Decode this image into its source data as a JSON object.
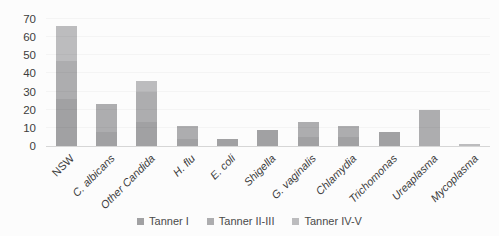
{
  "chart_data": {
    "type": "bar",
    "stacked": true,
    "title": "",
    "categories": [
      "NSW",
      "C. albicans",
      "Other Candida",
      "H. flu",
      "E. coli",
      "Shigella",
      "G. vaginalis",
      "Chlamydia",
      "Trichomonas",
      "Ureaplasma",
      "Mycoplasma"
    ],
    "categories_italic": [
      false,
      true,
      true,
      true,
      true,
      true,
      true,
      true,
      true,
      true,
      true
    ],
    "series": [
      {
        "name": "Tanner I",
        "color": "#a1a1a3",
        "values": [
          26,
          8,
          13,
          4,
          4,
          9,
          5,
          5,
          8,
          0,
          0
        ]
      },
      {
        "name": "Tanner II-III",
        "color": "#adadaf",
        "values": [
          21,
          15,
          17,
          7,
          0,
          0,
          8,
          6,
          0,
          20,
          0
        ]
      },
      {
        "name": "Tanner IV-V",
        "color": "#bcbcbe",
        "values": [
          19,
          0,
          6,
          0,
          0,
          0,
          0,
          0,
          0,
          0,
          1
        ]
      }
    ],
    "totals": [
      66,
      23,
      36,
      11,
      4,
      9,
      13,
      11,
      8,
      20,
      1
    ],
    "ylim": [
      0,
      70
    ],
    "yticks": [
      0,
      10,
      20,
      30,
      40,
      50,
      60,
      70
    ],
    "xlabel": "",
    "ylabel": "",
    "grid": false,
    "legend_position": "bottom",
    "axis_text_color": "#3d3d3d",
    "background": "#fcfcfc"
  }
}
